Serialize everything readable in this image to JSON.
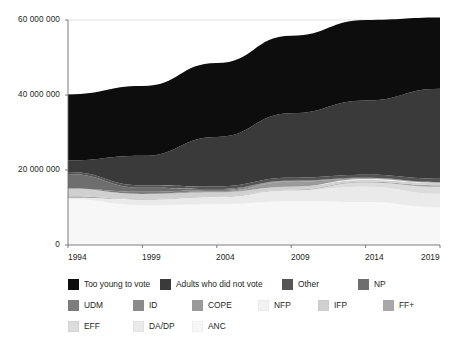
{
  "chart_data": {
    "type": "area",
    "stacked": true,
    "title": "",
    "xlabel": "",
    "ylabel": "",
    "x": [
      1994,
      1999,
      2004,
      2009,
      2014,
      2019
    ],
    "xticklabels": [
      "1994",
      "1999",
      "2004",
      "2009",
      "2014",
      "2019"
    ],
    "ylim": [
      0,
      60000000
    ],
    "yticks": [
      0,
      20000000,
      40000000,
      60000000
    ],
    "yticklabels": [
      "0",
      "20 000 000",
      "40 000 000",
      "60 000 000"
    ],
    "grid": true,
    "legend_position": "bottom",
    "stack_order_bottom_to_top": [
      "ANC",
      "DA/DP",
      "EFF",
      "FF+",
      "IFP",
      "NFP",
      "COPE",
      "ID",
      "UDM",
      "NP",
      "Other",
      "Adults who did not vote",
      "Too young to vote"
    ],
    "series": [
      {
        "name": "Too young to vote",
        "color": "#0d0d0d",
        "values": [
          17600000,
          18600000,
          19700000,
          20700000,
          21500000,
          19000000
        ]
      },
      {
        "name": "Adults who did not vote",
        "color": "#3a3a3a",
        "values": [
          3100000,
          7900000,
          13200000,
          17200000,
          19800000,
          24000000
        ]
      },
      {
        "name": "Other",
        "color": "#555555",
        "values": [
          500000,
          600000,
          700000,
          750000,
          800000,
          900000
        ]
      },
      {
        "name": "NP",
        "color": "#6e6e6e",
        "values": [
          3900000,
          1100000,
          260000,
          0,
          0,
          0
        ]
      },
      {
        "name": "UDM",
        "color": "#7d7d7d",
        "values": [
          0,
          550000,
          360000,
          150000,
          185000,
          78000
        ]
      },
      {
        "name": "ID",
        "color": "#8a8a8a",
        "values": [
          0,
          0,
          270000,
          162000,
          0,
          0
        ]
      },
      {
        "name": "COPE",
        "color": "#9a9a9a",
        "values": [
          0,
          0,
          0,
          1310000,
          124000,
          47000
        ]
      },
      {
        "name": "NFP",
        "color": "#f2f2f2",
        "values": [
          0,
          0,
          0,
          0,
          288000,
          89000
        ]
      },
      {
        "name": "IFP",
        "color": "#d0d0d0",
        "values": [
          2050000,
          1370000,
          1090000,
          800000,
          441000,
          588000
        ]
      },
      {
        "name": "FF+",
        "color": "#a8a8a8",
        "values": [
          424000,
          127000,
          139000,
          146000,
          166000,
          414000
        ]
      },
      {
        "name": "EFF",
        "color": "#dcdcdc",
        "values": [
          0,
          0,
          0,
          0,
          1170000,
          1882000
        ]
      },
      {
        "name": "DA/DP",
        "color": "#eaeaea",
        "values": [
          338000,
          1527000,
          1931000,
          2945000,
          4092000,
          3622000
        ]
      },
      {
        "name": "ANC",
        "color": "#f7f7f7",
        "values": [
          12237000,
          10601000,
          10880000,
          11650000,
          11436000,
          10026000
        ]
      }
    ]
  },
  "axes": {
    "yticklabels": [
      "60 000 000",
      "40 000 000",
      "20 000 000",
      "0"
    ],
    "xticklabels": [
      "1994",
      "1999",
      "2004",
      "2009",
      "2014",
      "2019"
    ]
  },
  "legend": {
    "rows": [
      [
        {
          "label": "Too young to vote",
          "color": "#0d0d0d"
        },
        {
          "label": "Adults who did not vote",
          "color": "#3a3a3a"
        },
        {
          "label": "Other",
          "color": "#555555"
        },
        {
          "label": "NP",
          "color": "#6e6e6e"
        }
      ],
      [
        {
          "label": "UDM",
          "color": "#7d7d7d"
        },
        {
          "label": "ID",
          "color": "#8a8a8a"
        },
        {
          "label": "COPE",
          "color": "#9a9a9a"
        },
        {
          "label": "NFP",
          "color": "#f2f2f2"
        },
        {
          "label": "IFP",
          "color": "#d0d0d0"
        },
        {
          "label": "FF+",
          "color": "#a8a8a8"
        }
      ],
      [
        {
          "label": "EFF",
          "color": "#dcdcdc"
        },
        {
          "label": "DA/DP",
          "color": "#eaeaea"
        },
        {
          "label": "ANC",
          "color": "#f7f7f7"
        }
      ]
    ]
  }
}
